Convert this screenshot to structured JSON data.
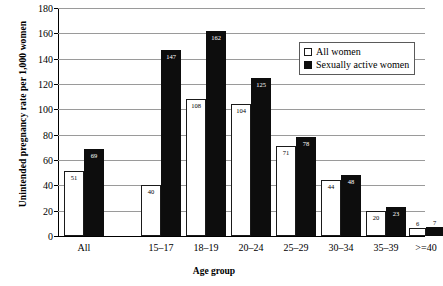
{
  "chart_data": {
    "type": "bar",
    "title": "",
    "xlabel": "Age group",
    "ylabel": "Unintended pregnancy rate per 1,000 women",
    "categories": [
      "All",
      "15–17",
      "18–19",
      "20–24",
      "25–29",
      "30–34",
      "35–39",
      ">=40"
    ],
    "series": [
      {
        "name": "All women",
        "values": [
          51,
          40,
          108,
          104,
          71,
          44,
          20,
          6
        ],
        "color": "#ffffff",
        "swatch": "hollow"
      },
      {
        "name": "Sexually active women",
        "values": [
          69,
          147,
          162,
          125,
          78,
          48,
          23,
          7
        ],
        "color": "#0d0d0d",
        "swatch": "solid"
      }
    ],
    "ylim": [
      0,
      180
    ],
    "yticks": [
      0,
      20,
      40,
      60,
      80,
      100,
      120,
      140,
      160,
      180
    ],
    "ytick_labels": [
      "0",
      "20",
      "40",
      "60",
      "80",
      "100",
      "120",
      "140",
      "160",
      "180"
    ],
    "grid": true,
    "legend_position": "upper right",
    "show_value_labels": true
  },
  "legend": {
    "entries": [
      {
        "label": "All women"
      },
      {
        "label": "Sexually active women"
      }
    ]
  }
}
